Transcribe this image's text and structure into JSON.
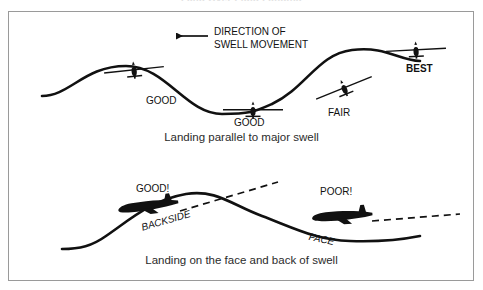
{
  "header": {
    "clipped_title": "Land  Over  Fluid Landing"
  },
  "figure": {
    "frame_border_color": "#9a9a9a",
    "background_color": "#ffffff",
    "ink_color": "#111111"
  },
  "panels": [
    {
      "id": "panel-parallel",
      "caption": "Landing parallel to major swell",
      "annotation": {
        "name": "direction-of-swell-movement",
        "line1": "DIRECTION OF",
        "line2": "SWELL MOVEMENT",
        "arrow": "left-arrow-icon"
      },
      "aircraft": [
        {
          "name": "aircraft-good-crest-left",
          "label": "GOOD",
          "rating": "GOOD"
        },
        {
          "name": "aircraft-good-trough",
          "label": "GOOD",
          "rating": "GOOD"
        },
        {
          "name": "aircraft-fair-face",
          "label": "FAIR",
          "rating": "FAIR"
        },
        {
          "name": "aircraft-best-crest-right",
          "label": "BEST",
          "rating": "BEST"
        }
      ],
      "labels": {
        "good_left": "GOOD",
        "good_mid": "GOOD",
        "fair": "FAIR",
        "best": "BEST"
      }
    },
    {
      "id": "panel-face-back",
      "caption": "Landing on the face and back of swell",
      "aircraft": [
        {
          "name": "aircraft-good-backside",
          "label": "GOOD!",
          "rating": "GOOD!"
        },
        {
          "name": "aircraft-poor-face",
          "label": "POOR!",
          "rating": "POOR!"
        }
      ],
      "labels": {
        "good": "GOOD!",
        "poor": "POOR!",
        "backside": "BACKSIDE",
        "face": "FACE"
      }
    }
  ]
}
